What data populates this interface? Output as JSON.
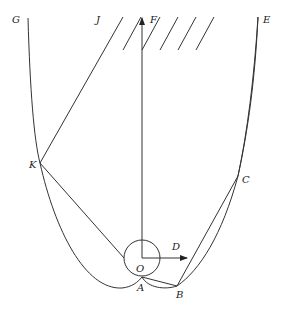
{
  "diagram": {
    "type": "physics-geometry",
    "labels": {
      "G": "G",
      "J": "J",
      "F": "F",
      "E": "E",
      "K": "K",
      "C": "C",
      "D": "D",
      "O": "O",
      "A": "A",
      "B": "B"
    },
    "elements": [
      {
        "name": "ceiling-hatching",
        "description": "fixed support hatching at top"
      },
      {
        "name": "force-arrow-F",
        "description": "vertical arrow from O upward to F"
      },
      {
        "name": "velocity-arrow-D",
        "description": "horizontal arrow from O toward D"
      },
      {
        "name": "circle-O",
        "description": "small circle centered at O"
      },
      {
        "name": "curve-GKAB",
        "description": "curve from G through K to cusp A"
      },
      {
        "name": "curve-ABCE",
        "description": "curves from A through B and C to E"
      },
      {
        "name": "line-JK",
        "description": "straight line from J to K"
      },
      {
        "name": "line-KO",
        "description": "line from K toward circle"
      },
      {
        "name": "line-OB",
        "description": "line from O to B"
      },
      {
        "name": "line-BE",
        "description": "line from B through C to E"
      }
    ],
    "colors": {
      "stroke": "#333333",
      "background": "#ffffff"
    }
  }
}
